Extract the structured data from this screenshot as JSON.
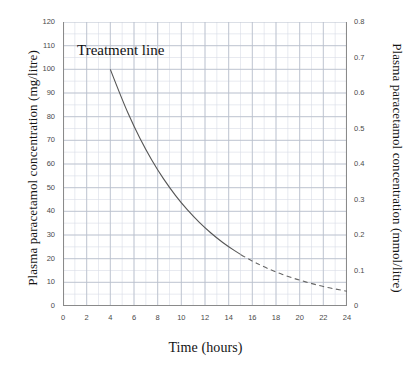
{
  "chart_data": {
    "type": "line",
    "title": "",
    "xlabel": "Time (hours)",
    "ylabel": "Plasma paracetamol concentration (mg/litre)",
    "ylabel_right": "Plasma paracetamol concentration (mmol/litre)",
    "xlim": [
      0,
      24
    ],
    "ylim": [
      0,
      120
    ],
    "ylim_right": [
      0,
      0.8
    ],
    "grid": true,
    "legend": "none",
    "xticks": [
      0,
      2,
      4,
      6,
      8,
      10,
      12,
      14,
      16,
      18,
      20,
      22,
      24
    ],
    "xtick_labels": [
      "0",
      "2",
      "4",
      "6",
      "8",
      "10",
      "12",
      "14",
      "16",
      "18",
      "20",
      "22",
      "24"
    ],
    "yticks": [
      0,
      10,
      20,
      30,
      40,
      50,
      60,
      70,
      80,
      90,
      100,
      110,
      120
    ],
    "ytick_labels": [
      "0",
      "10",
      "20",
      "30",
      "40",
      "50",
      "60",
      "70",
      "80",
      "90",
      "100",
      "110",
      "120"
    ],
    "yticks_right": [
      0,
      0.1,
      0.2,
      0.3,
      0.4,
      0.5,
      0.6,
      0.7,
      0.8
    ],
    "ytick_labels_right": [
      "0",
      "0.1",
      "0.2",
      "0.3",
      "0.4",
      "0.5",
      "0.6",
      "0.7",
      "0.8"
    ],
    "minor_grid_x_step": 1,
    "minor_grid_y_step": 5,
    "annotations": [
      {
        "text": "Treatment line",
        "x": 4.6,
        "y": 110
      }
    ],
    "series": [
      {
        "name": "Treatment line",
        "style": "solid-then-dashed",
        "solid_range": [
          4,
          15
        ],
        "dashed_range": [
          15,
          24
        ],
        "color": "#555555",
        "x": [
          4,
          5,
          6,
          7,
          8,
          9,
          10,
          11,
          12,
          13,
          14,
          15,
          16,
          17,
          18,
          19,
          20,
          21,
          22,
          23,
          24
        ],
        "y": [
          100,
          87.1,
          75.8,
          66.0,
          57.4,
          50.0,
          43.5,
          37.9,
          33.0,
          28.7,
          25.0,
          21.8,
          18.9,
          16.5,
          14.3,
          12.5,
          10.9,
          9.5,
          8.2,
          7.2,
          6.2
        ]
      }
    ]
  },
  "colors": {
    "curve": "#555555",
    "major_grid": "#b8bfcc",
    "minor_grid": "#d8dce5",
    "axis": "#8a8a8a",
    "text": "#1a1a1a"
  }
}
